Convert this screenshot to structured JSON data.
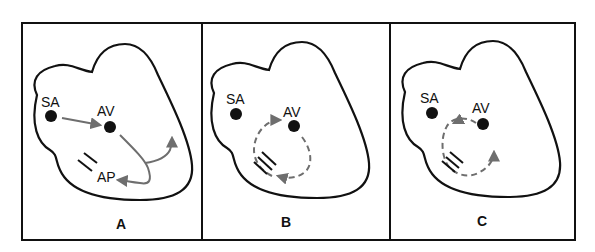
{
  "figure": {
    "panels": [
      {
        "id": "A",
        "label": "A",
        "nodes": {
          "sa": "SA",
          "av": "AV",
          "ap": "AP"
        },
        "description": "Normal conduction SA to AV with accessory pathway (AP) also activated"
      },
      {
        "id": "B",
        "label": "B",
        "nodes": {
          "sa": "SA",
          "av": "AV"
        },
        "description": "Reentrant circuit: dashed loop through AV node and accessory pathway, clockwise"
      },
      {
        "id": "C",
        "label": "C",
        "nodes": {
          "sa": "SA",
          "av": "AV"
        },
        "description": "Reentrant circuit: dashed loop in opposite (counter-clockwise) direction"
      }
    ],
    "colors": {
      "outline": "#111111",
      "arrow": "#6e6e6e",
      "background": "#ffffff"
    }
  }
}
